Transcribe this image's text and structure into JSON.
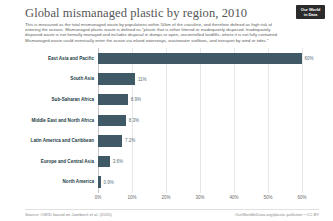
{
  "header": {
    "title": "Global mismanaged plastic by region, 2010",
    "subtitle": "This is measured as the total mismanaged waste by populations within 50km of the coastline, and therefore defined as high risk of entering the oceans. Mismanaged plastic waste is defined as \"plastic that is either littered or inadequately disposed. Inadequately disposed waste is not formally managed and includes disposal in dumps or open, uncontrolled landfills, where it is not fully contained. Mismanaged waste could eventually enter the ocean via inland waterways, wastewater outflows, and transport by wind or tides.\"",
    "logo_line1": "Our World",
    "logo_line2": "in Data"
  },
  "footer": {
    "source": "Source: OWID based on Jambeck et al. (2015)",
    "link": "OurWorldInData.org/plastic-pollution • CC BY"
  },
  "colors": {
    "bar": "#3f5a66",
    "gridline": "#e7e7e7",
    "axis_text": "#6b6b6b",
    "label_text": "#1d3d47"
  },
  "chart_data": {
    "type": "bar",
    "orientation": "horizontal",
    "title": "Global mismanaged plastic by region, 2010",
    "xlabel": "",
    "ylabel": "",
    "xlim": [
      0,
      65
    ],
    "grid": true,
    "legend": "none",
    "unit": "%",
    "xticks": [
      0,
      10,
      20,
      30,
      40,
      50,
      60
    ],
    "xtick_labels": [
      "0%",
      "10%",
      "20%",
      "30%",
      "40%",
      "50%",
      "60%"
    ],
    "categories": [
      "East Asia and Pacific",
      "South Asia",
      "Sub-Saharan Africa",
      "Middle East and North Africa",
      "Latin America and Caribbean",
      "Europe and Central Asia",
      "North America"
    ],
    "values": [
      60,
      11,
      8.9,
      8.3,
      7.2,
      3.6,
      0.9
    ],
    "value_labels": [
      "60%",
      "11%",
      "8.9%",
      "8.3%",
      "7.2%",
      "3.6%",
      "0.9%"
    ]
  }
}
